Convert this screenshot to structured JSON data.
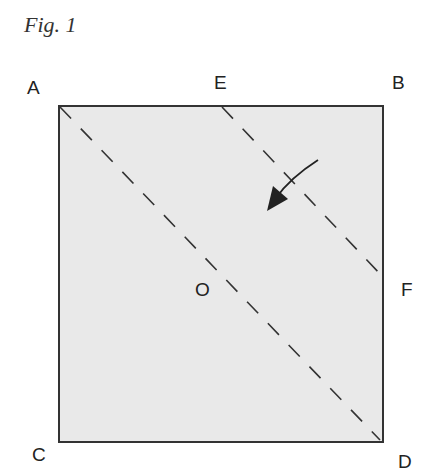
{
  "figure": {
    "title": "Fig. 1",
    "fill_color": "#e9e9e9",
    "stroke_color": "#333333",
    "square": {
      "left": 59,
      "top": 106,
      "right": 383,
      "bottom": 442
    },
    "labels": {
      "A": "A",
      "B": "B",
      "C": "C",
      "D": "D",
      "E": "E",
      "F": "F",
      "O": "O"
    },
    "fold_lines": [
      {
        "name": "diagonal-AD",
        "from": "A",
        "to": "D",
        "style": "dashed"
      },
      {
        "name": "fold-EF",
        "from": "E",
        "to": "F",
        "style": "dashed"
      }
    ],
    "arrow": {
      "direction": "down-left",
      "meaning": "fold direction"
    }
  }
}
